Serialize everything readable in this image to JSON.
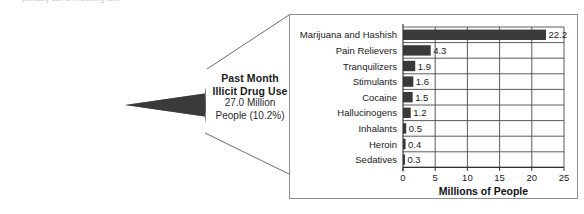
{
  "figure": {
    "top_cutoff_text": "partially cut-off heading text",
    "pie": {
      "major": {
        "title_line1": "No Past Month",
        "title_line2": "Illicit Drug Use",
        "value_line1": "238.1 Million",
        "value_line2": "People (89.8%)",
        "value": 89.8,
        "color": "#808080",
        "text_color": "#ffffff"
      },
      "minor": {
        "title_line1": "Past Month",
        "title_line2": "Illicit Drug Use",
        "value_line1": "27.0 Million",
        "value_line2": "People (10.2%)",
        "value": 10.2,
        "color": "#3a3a3a",
        "text_color": "#1b1b1b"
      }
    }
  },
  "chart_data": {
    "type": "bar",
    "orientation": "horizontal",
    "title": "",
    "xlabel": "Millions of People",
    "ylabel": "",
    "xlim": [
      0,
      25
    ],
    "xticks": [
      0,
      5,
      10,
      15,
      20,
      25
    ],
    "xtick_labels": [
      "0",
      "5",
      "10",
      "15",
      "20",
      "25"
    ],
    "grid": true,
    "legend": false,
    "bar_color": "#3a3a3a",
    "categories": [
      "Marijuana and Hashish",
      "Pain Relievers",
      "Tranquilizers",
      "Stimulants",
      "Cocaine",
      "Hallucinogens",
      "Inhalants",
      "Heroin",
      "Sedatives"
    ],
    "values": [
      22.2,
      4.3,
      1.9,
      1.6,
      1.5,
      1.2,
      0.5,
      0.4,
      0.3
    ],
    "value_labels": [
      "22.2",
      "4.3",
      "1.9",
      "1.6",
      "1.5",
      "1.2",
      "0.5",
      "0.4",
      "0.3"
    ]
  }
}
